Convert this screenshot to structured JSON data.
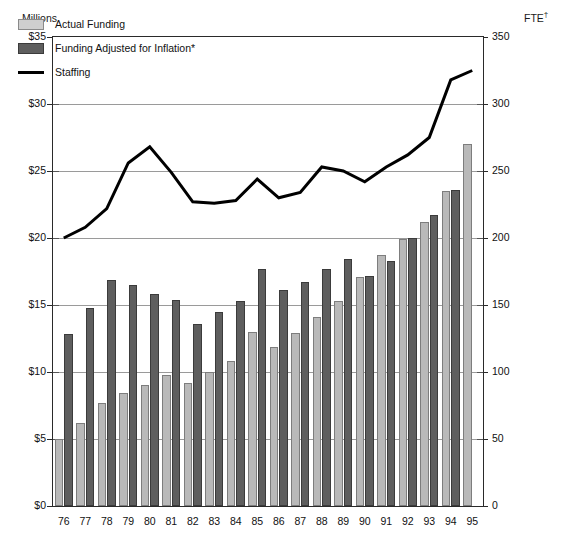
{
  "axes": {
    "left_title": "Millions",
    "right_title": "FTE",
    "right_title_marker": "†",
    "left_ticks": [
      "$0",
      "$5",
      "$10",
      "$15",
      "$20",
      "$25",
      "$30",
      "$35"
    ],
    "right_ticks": [
      "0",
      "50",
      "100",
      "150",
      "200",
      "250",
      "300",
      "350"
    ]
  },
  "legend": {
    "items": [
      {
        "label": "Actual Funding",
        "key": "actual",
        "color": "#cfcfcf"
      },
      {
        "label": "Funding Adjusted for Inflation*",
        "key": "inflation",
        "color": "#5e5e5e"
      },
      {
        "label": "Staffing",
        "key": "staffing",
        "color": "#000000"
      }
    ]
  },
  "chart_data": {
    "type": "bar",
    "title": "",
    "subtitle": "",
    "xlabel": "",
    "ylabel": "Millions",
    "y2label": "FTE",
    "ylim": [
      0,
      35
    ],
    "y2lim": [
      0,
      350
    ],
    "ytick_step": 5,
    "y2tick_step": 50,
    "grid": true,
    "legend_position": "inside-top-left",
    "categories": [
      "76",
      "77",
      "78",
      "79",
      "80",
      "81",
      "82",
      "83",
      "84",
      "85",
      "86",
      "87",
      "88",
      "89",
      "90",
      "91",
      "92",
      "93",
      "94",
      "95"
    ],
    "series": [
      {
        "name": "Actual Funding",
        "type": "bar",
        "axis": "left",
        "unit": "$ millions",
        "color": "#b9b9b9",
        "values": [
          5.0,
          6.2,
          7.7,
          8.4,
          9.0,
          9.8,
          9.2,
          10.0,
          10.8,
          13.0,
          11.9,
          12.9,
          14.1,
          15.3,
          17.1,
          18.7,
          19.9,
          21.2,
          23.5,
          27.0
        ]
      },
      {
        "name": "Funding Adjusted for Inflation*",
        "type": "bar",
        "axis": "left",
        "unit": "$ millions",
        "color": "#5e5e5e",
        "values": [
          12.8,
          14.8,
          16.9,
          16.5,
          15.8,
          15.4,
          13.6,
          14.5,
          15.3,
          17.7,
          16.1,
          16.7,
          17.7,
          18.4,
          17.2,
          18.3,
          20.0,
          21.7,
          23.6,
          0
        ]
      },
      {
        "name": "Staffing",
        "type": "line",
        "axis": "right",
        "unit": "FTE",
        "color": "#000000",
        "values": [
          200,
          208,
          222,
          256,
          268,
          249,
          227,
          226,
          228,
          244,
          230,
          234,
          253,
          250,
          242,
          253,
          262,
          275,
          318,
          325
        ]
      }
    ],
    "footnote_markers": [
      "*",
      "†"
    ]
  }
}
